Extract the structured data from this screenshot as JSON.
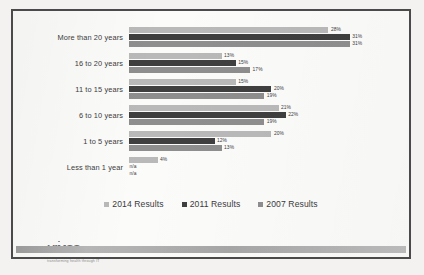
{
  "slide": {
    "logo": {
      "mark": "HIMSS",
      "tagline": "transforming health through IT",
      "dot_icon": "registered-dot"
    }
  },
  "chart_data": {
    "type": "bar",
    "orientation": "horizontal",
    "title": "",
    "xlabel": "",
    "ylabel": "",
    "xlim": [
      0,
      33
    ],
    "grid": false,
    "legend_position": "bottom",
    "value_suffix": "%",
    "categories": [
      "More than 20 years",
      "16 to 20 years",
      "11 to 15 years",
      "6 to 10 years",
      "1 to 5 years",
      "Less than 1 year"
    ],
    "series": [
      {
        "name": "2014 Results",
        "color": "#b9b9b9",
        "values": [
          28,
          13,
          15,
          21,
          20,
          4
        ],
        "labels": [
          "28%",
          "13%",
          "15%",
          "21%",
          "20%",
          "4%"
        ]
      },
      {
        "name": "2011 Results",
        "color": "#3f3f3f",
        "values": [
          31,
          15,
          20,
          22,
          12,
          null
        ],
        "labels": [
          "31%",
          "15%",
          "20%",
          "22%",
          "12%",
          "n/a"
        ]
      },
      {
        "name": "2007 Results",
        "color": "#8e8e8e",
        "values": [
          31,
          17,
          19,
          19,
          13,
          null
        ],
        "labels": [
          "31%",
          "17%",
          "19%",
          "19%",
          "13%",
          "n/a"
        ]
      }
    ]
  }
}
